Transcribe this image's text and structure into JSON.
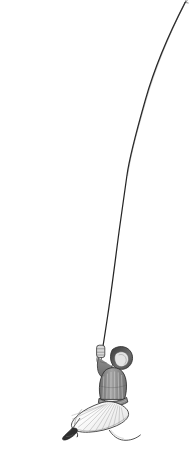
{
  "canvas": {
    "width": 195,
    "height": 449,
    "background_color": "#ffffff"
  },
  "title": {
    "text": "BEYOND WIDOW",
    "color": "#3c3c3c"
  },
  "illustration": {
    "name": "woman-climbing-rope-illustration",
    "description": "Pencil-style drawing of a woman in a pleated skirt hanging from a long rope that runs from the upper right corner down to her gloved hand",
    "line_color": "#2b2b2b",
    "shade_color": "#8e8e8e",
    "skirt_color": "#fbfbfb",
    "bodice_color": "#9a9a9a",
    "hair_color": "#4a4a4a",
    "shoe_color": "#2e2e2e",
    "parts": [
      "rope",
      "gloved-hand",
      "head",
      "bodice",
      "belt",
      "skirt",
      "shoe",
      "ribbon-tail"
    ]
  }
}
